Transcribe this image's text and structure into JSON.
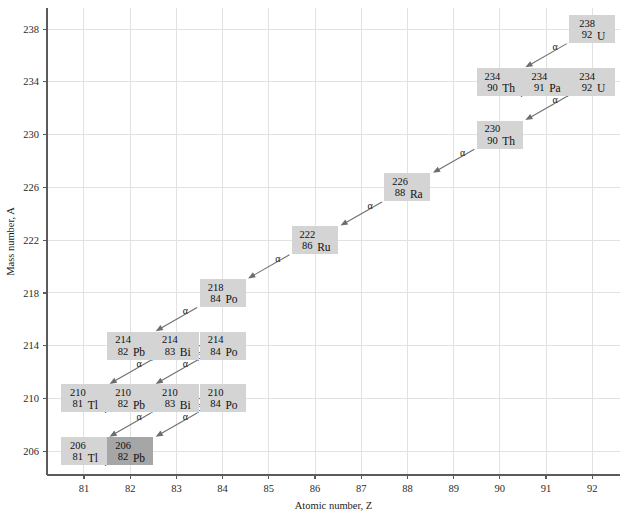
{
  "chart_data": {
    "type": "scatter",
    "title": "",
    "xlabel": "Atomic number, Z",
    "ylabel": "Mass number, A",
    "xlim": [
      80.2,
      92.6
    ],
    "ylim": [
      204.2,
      239.6
    ],
    "xticks": [
      81,
      82,
      83,
      84,
      85,
      86,
      87,
      88,
      89,
      90,
      91,
      92
    ],
    "yticks": [
      206,
      210,
      214,
      218,
      222,
      226,
      230,
      234,
      238
    ],
    "grid": true,
    "legend": "none",
    "nuclides": [
      {
        "id": "U238",
        "mass": "238",
        "z": "92",
        "symbol": "U",
        "x": 92,
        "y": 238,
        "terminal": false
      },
      {
        "id": "Th234",
        "mass": "234",
        "z": "90",
        "symbol": "Th",
        "x": 90,
        "y": 234,
        "terminal": false
      },
      {
        "id": "Pa234",
        "mass": "234",
        "z": "91",
        "symbol": "Pa",
        "x": 91,
        "y": 234,
        "terminal": false
      },
      {
        "id": "U234",
        "mass": "234",
        "z": "92",
        "symbol": "U",
        "x": 92,
        "y": 234,
        "terminal": false
      },
      {
        "id": "Th230",
        "mass": "230",
        "z": "90",
        "symbol": "Th",
        "x": 90,
        "y": 230,
        "terminal": false
      },
      {
        "id": "Ra226",
        "mass": "226",
        "z": "88",
        "symbol": "Ra",
        "x": 88,
        "y": 226,
        "terminal": false
      },
      {
        "id": "Rn222",
        "mass": "222",
        "z": "86",
        "symbol": "Ru",
        "x": 86,
        "y": 222,
        "terminal": false
      },
      {
        "id": "Po218",
        "mass": "218",
        "z": "84",
        "symbol": "Po",
        "x": 84,
        "y": 218,
        "terminal": false
      },
      {
        "id": "Pb214",
        "mass": "214",
        "z": "82",
        "symbol": "Pb",
        "x": 82,
        "y": 214,
        "terminal": false
      },
      {
        "id": "Bi214",
        "mass": "214",
        "z": "83",
        "symbol": "Bi",
        "x": 83,
        "y": 214,
        "terminal": false
      },
      {
        "id": "Po214",
        "mass": "214",
        "z": "84",
        "symbol": "Po",
        "x": 84,
        "y": 214,
        "terminal": false
      },
      {
        "id": "Tl210",
        "mass": "210",
        "z": "81",
        "symbol": "Tl",
        "x": 81,
        "y": 210,
        "terminal": false
      },
      {
        "id": "Pb210",
        "mass": "210",
        "z": "82",
        "symbol": "Pb",
        "x": 82,
        "y": 210,
        "terminal": false
      },
      {
        "id": "Bi210",
        "mass": "210",
        "z": "83",
        "symbol": "Bi",
        "x": 83,
        "y": 210,
        "terminal": false
      },
      {
        "id": "Po210",
        "mass": "210",
        "z": "84",
        "symbol": "Po",
        "x": 84,
        "y": 210,
        "terminal": false
      },
      {
        "id": "Tl206",
        "mass": "206",
        "z": "81",
        "symbol": "Tl",
        "x": 81,
        "y": 206,
        "terminal": false
      },
      {
        "id": "Pb206",
        "mass": "206",
        "z": "82",
        "symbol": "Pb",
        "x": 82,
        "y": 206,
        "terminal": true
      }
    ],
    "decays": [
      {
        "from": "U238",
        "to": "Th234",
        "type": "alpha",
        "label": "α"
      },
      {
        "from": "Th234",
        "to": "Pa234",
        "type": "beta",
        "label": "β"
      },
      {
        "from": "Pa234",
        "to": "U234",
        "type": "beta",
        "label": "β"
      },
      {
        "from": "U234",
        "to": "Th230",
        "type": "alpha",
        "label": "α"
      },
      {
        "from": "Th230",
        "to": "Ra226",
        "type": "alpha",
        "label": "α"
      },
      {
        "from": "Ra226",
        "to": "Rn222",
        "type": "alpha",
        "label": "α"
      },
      {
        "from": "Rn222",
        "to": "Po218",
        "type": "alpha",
        "label": "α"
      },
      {
        "from": "Po218",
        "to": "Pb214",
        "type": "alpha",
        "label": "α"
      },
      {
        "from": "Pb214",
        "to": "Bi214",
        "type": "beta",
        "label": "β"
      },
      {
        "from": "Bi214",
        "to": "Po214",
        "type": "beta",
        "label": "β"
      },
      {
        "from": "Bi214",
        "to": "Tl210",
        "type": "alpha",
        "label": "α"
      },
      {
        "from": "Po214",
        "to": "Pb210",
        "type": "alpha",
        "label": "α"
      },
      {
        "from": "Tl210",
        "to": "Pb210",
        "type": "beta",
        "label": "β"
      },
      {
        "from": "Pb210",
        "to": "Bi210",
        "type": "beta",
        "label": "β"
      },
      {
        "from": "Bi210",
        "to": "Po210",
        "type": "beta",
        "label": "β"
      },
      {
        "from": "Bi210",
        "to": "Tl206",
        "type": "alpha",
        "label": "α"
      },
      {
        "from": "Po210",
        "to": "Pb206",
        "type": "alpha",
        "label": "α"
      },
      {
        "from": "Tl206",
        "to": "Pb206",
        "type": "beta",
        "label": "β"
      }
    ]
  },
  "colors": {
    "box_fill": "#d4d4d4",
    "box_fill_terminal": "#a6a6a6",
    "grid": "#e2e2e2",
    "axis": "#5b5b5b",
    "arrow": "#6d6d6d",
    "text": "#101010"
  }
}
